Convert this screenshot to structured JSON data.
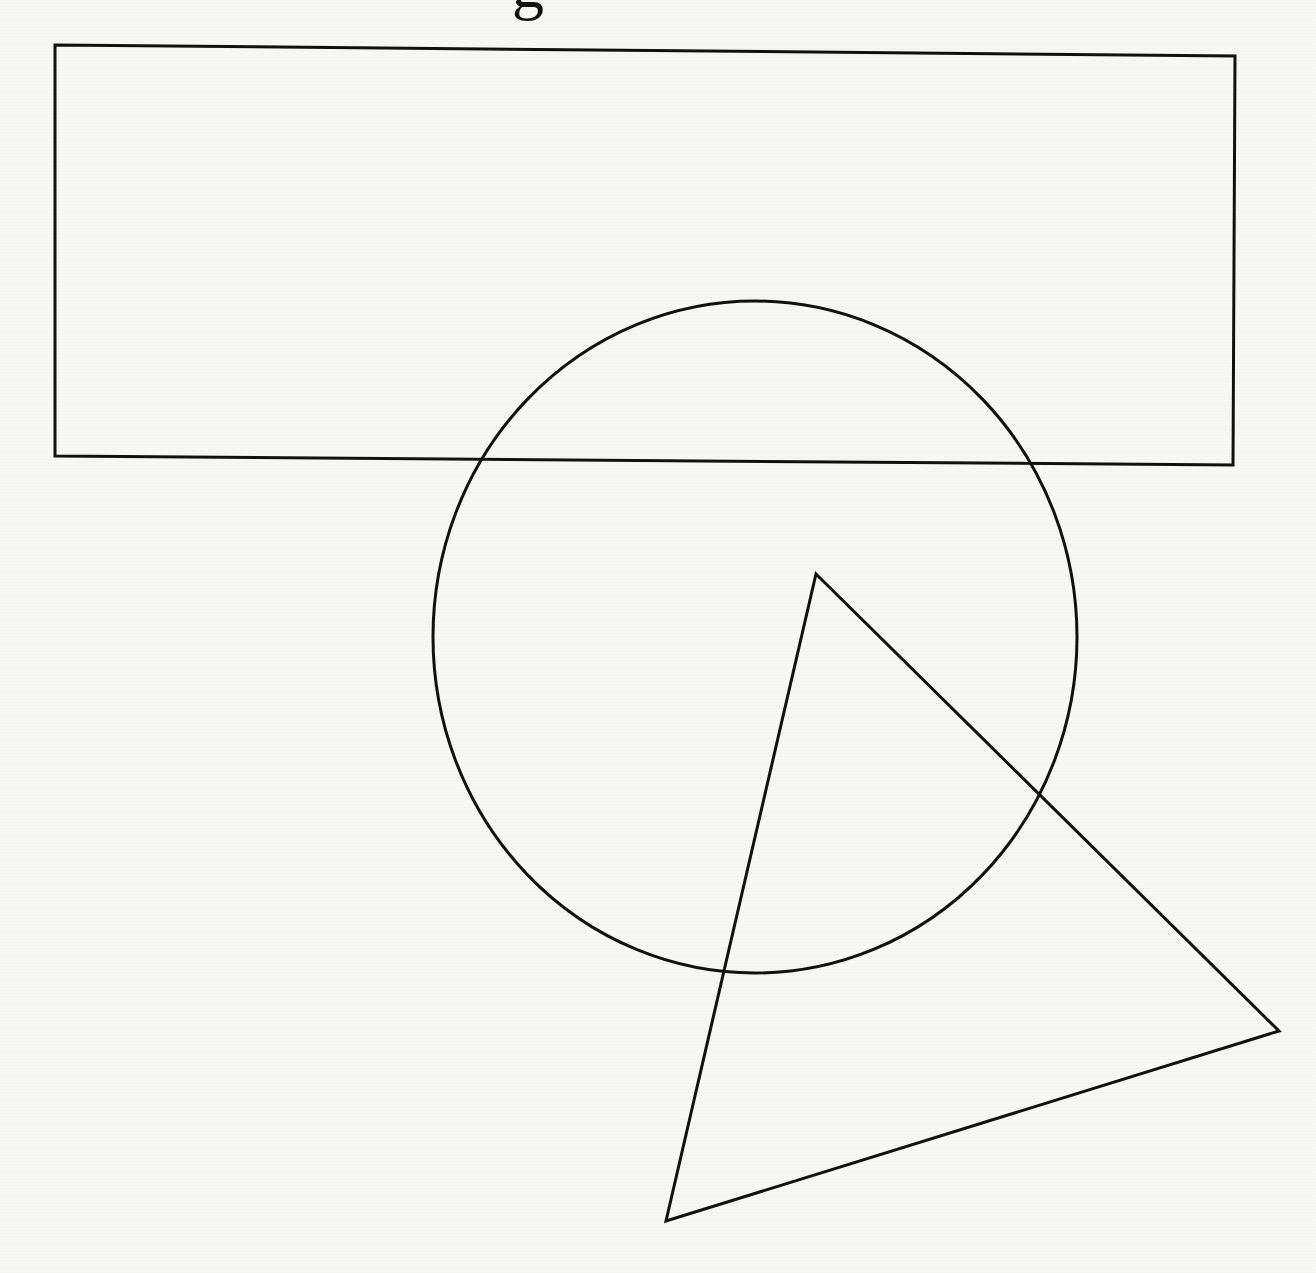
{
  "page": {
    "background": "#f7f7f5",
    "stroke_color": "#111111",
    "stroke_width": 3
  },
  "header_fragment": {
    "text": "g"
  },
  "shapes": {
    "rectangle": {
      "points": "55,45 1235,56 1233,465 55,456"
    },
    "circle": {
      "cx": 755,
      "cy": 637,
      "rx": 322,
      "ry": 336
    },
    "triangle": {
      "points": "816,574 1279,1031 666,1221"
    }
  }
}
